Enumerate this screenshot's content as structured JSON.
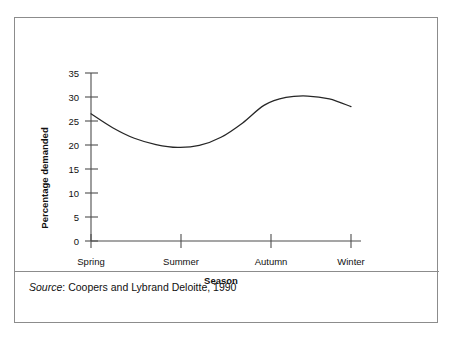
{
  "figure": {
    "source_prefix": "Source",
    "source_separator": ":",
    "source_text": "Coopers and Lybrand Deloitte, 1990"
  },
  "chart_data": {
    "type": "line",
    "title": "",
    "subtitle": "",
    "xlabel": "Season",
    "ylabel": "Percentage demanded",
    "categories": [
      "Spring",
      "Summer",
      "Autumn",
      "Winter"
    ],
    "x": [
      0,
      1,
      2,
      3
    ],
    "values": [
      26.5,
      19.5,
      29.5,
      28.0
    ],
    "series": [
      {
        "name": "Percentage demanded",
        "values": [
          26.5,
          19.5,
          29.5,
          28.0
        ],
        "color": "#262626"
      }
    ],
    "curve_points": [
      {
        "x": 0.0,
        "y": 26.5
      },
      {
        "x": 0.25,
        "y": 23.6
      },
      {
        "x": 0.5,
        "y": 21.4
      },
      {
        "x": 0.75,
        "y": 20.1
      },
      {
        "x": 1.0,
        "y": 19.5
      },
      {
        "x": 1.25,
        "y": 19.9
      },
      {
        "x": 1.5,
        "y": 21.6
      },
      {
        "x": 1.75,
        "y": 24.6
      },
      {
        "x": 2.0,
        "y": 28.3
      },
      {
        "x": 2.25,
        "y": 29.9
      },
      {
        "x": 2.5,
        "y": 30.2
      },
      {
        "x": 2.75,
        "y": 29.6
      },
      {
        "x": 3.0,
        "y": 28.0
      }
    ],
    "y_ticks": [
      0,
      5,
      10,
      15,
      20,
      25,
      30,
      35
    ],
    "ylim": [
      0,
      35
    ],
    "xlim": [
      0,
      3
    ],
    "grid": false,
    "legend": false,
    "legend_position": "none",
    "peak_value": 30.2,
    "min_value": 19.5,
    "series_color": "#262626",
    "axis_color": "#4d4d4d",
    "frame_color": "#8c8c8c"
  }
}
